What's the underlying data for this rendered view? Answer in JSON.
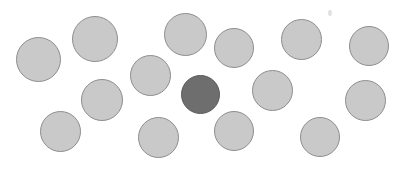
{
  "display": {
    "name": "visual-search-display",
    "width": 405,
    "height": 169,
    "background_color": "#ffffff",
    "total_items": 15,
    "distractor_count": 14,
    "target_count": 1
  },
  "colors": {
    "distractor_fill": "#c9c9c9",
    "distractor_stroke": "#8e8e8e",
    "target_fill": "#6e6e6e",
    "target_stroke": "#5a5a5a",
    "background": "#ffffff",
    "speckle": "#d8d8d8"
  },
  "chart_data": {
    "type": "scatter",
    "title": "",
    "xlabel": "",
    "ylabel": "",
    "xlim": [
      0,
      405
    ],
    "ylim": [
      0,
      169
    ],
    "grid": false,
    "legend": null,
    "series": [
      {
        "name": "distractors",
        "role": "distractor",
        "fill": "#c9c9c9",
        "stroke": "#8e8e8e",
        "points": [
          {
            "id": "d1",
            "cx": 38,
            "cy": 59,
            "d": 45
          },
          {
            "id": "d2",
            "cx": 95,
            "cy": 39,
            "d": 46
          },
          {
            "id": "d3",
            "cx": 185,
            "cy": 34,
            "d": 43
          },
          {
            "id": "d4",
            "cx": 234,
            "cy": 48,
            "d": 40
          },
          {
            "id": "d5",
            "cx": 301,
            "cy": 39,
            "d": 41
          },
          {
            "id": "d6",
            "cx": 369,
            "cy": 46,
            "d": 40
          },
          {
            "id": "d7",
            "cx": 150,
            "cy": 75,
            "d": 41
          },
          {
            "id": "d8",
            "cx": 102,
            "cy": 100,
            "d": 42
          },
          {
            "id": "d9",
            "cx": 272,
            "cy": 90,
            "d": 41
          },
          {
            "id": "d10",
            "cx": 365,
            "cy": 100,
            "d": 41
          },
          {
            "id": "d11",
            "cx": 60,
            "cy": 131,
            "d": 41
          },
          {
            "id": "d12",
            "cx": 158,
            "cy": 137,
            "d": 41
          },
          {
            "id": "d13",
            "cx": 234,
            "cy": 131,
            "d": 40
          },
          {
            "id": "d14",
            "cx": 320,
            "cy": 137,
            "d": 40
          }
        ]
      },
      {
        "name": "target",
        "role": "target",
        "fill": "#6e6e6e",
        "stroke": "#5a5a5a",
        "points": [
          {
            "id": "t1",
            "cx": 200,
            "cy": 94,
            "d": 39
          }
        ]
      }
    ],
    "artifacts": [
      {
        "id": "s1",
        "cx": 330,
        "cy": 13,
        "w": 4,
        "h": 6
      }
    ]
  }
}
